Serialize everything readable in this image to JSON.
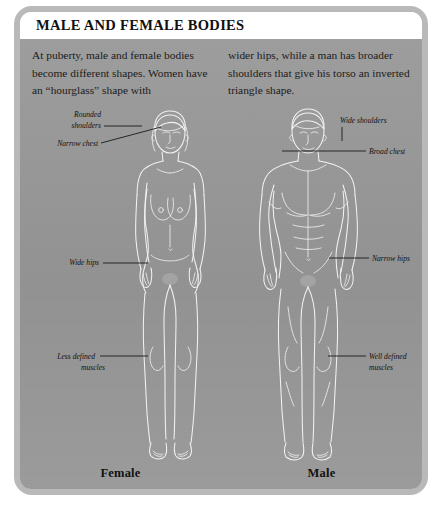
{
  "panel": {
    "title": "MALE AND FEMALE BODIES",
    "background_color": "#989898",
    "frame_color": "#b9b9b9",
    "ink_color": "#ffffff"
  },
  "intro": {
    "left_column": "At puberty, male and female bodies become different shapes. Women have an “hourglass” shape with",
    "right_column": "wider hips, while a man has broader shoulders that give his torso an inverted triangle shape."
  },
  "figures": {
    "female": {
      "caption": "Female",
      "labels": [
        {
          "id": "rounded-shoulders",
          "line1": "Rounded",
          "line2": "shoulders"
        },
        {
          "id": "narrow-chest",
          "line1": "Narrow chest",
          "line2": ""
        },
        {
          "id": "wide-hips",
          "line1": "Wide hips",
          "line2": ""
        },
        {
          "id": "less-defined-muscles",
          "line1": "Less defined",
          "line2": "muscles"
        }
      ]
    },
    "male": {
      "caption": "Male",
      "labels": [
        {
          "id": "wide-shoulders",
          "line1": "Wide shoulders",
          "line2": ""
        },
        {
          "id": "broad-chest",
          "line1": "Broad chest",
          "line2": ""
        },
        {
          "id": "narrow-hips",
          "line1": "Narrow hips",
          "line2": ""
        },
        {
          "id": "well-defined-muscles",
          "line1": "Well defined",
          "line2": "muscles"
        }
      ]
    }
  }
}
